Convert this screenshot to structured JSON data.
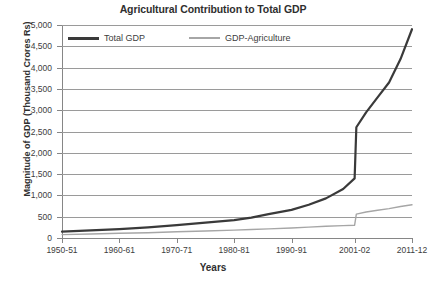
{
  "chart_data": {
    "type": "line",
    "title": "Agricultural Contribution to Total GDP",
    "xlabel": "Years",
    "ylabel": "Magnitude of GDP (Thousand Crores Rs)",
    "ylim": [
      0,
      5000
    ],
    "yticks": [
      0,
      500,
      1000,
      1500,
      2000,
      2500,
      3000,
      3500,
      4000,
      4500,
      5000
    ],
    "ytick_labels": [
      "0",
      "500",
      "1,000",
      "1,500",
      "2,000",
      "2,500",
      "3,000",
      "3,500",
      "4,000",
      "4,500",
      "5,000"
    ],
    "grid": true,
    "legend_position": "top-left-inside",
    "categories": [
      "1950-51",
      "1960-61",
      "1970-71",
      "1980-81",
      "1990-91",
      "2001-02",
      "2011-12"
    ],
    "xtick_labels": [
      "1950-51",
      "1960-61",
      "1970-71",
      "1980-81",
      "1990-91",
      "2001-02",
      "2011-12"
    ],
    "series": [
      {
        "name": "Total GDP",
        "color": "#3a3a3a",
        "width": 2.2,
        "x": [
          1950,
          1955,
          1960,
          1965,
          1970,
          1975,
          1980,
          1983,
          1986,
          1990,
          1993,
          1996,
          1999,
          2001,
          2001.3,
          2003,
          2005,
          2007,
          2009,
          2011
        ],
        "values": [
          150,
          180,
          210,
          250,
          300,
          360,
          420,
          480,
          560,
          660,
          780,
          930,
          1150,
          1400,
          2600,
          2950,
          3300,
          3650,
          4200,
          4900
        ]
      },
      {
        "name": "GDP-Agriculture",
        "color": "#a6a6a6",
        "width": 1.4,
        "x": [
          1950,
          1955,
          1960,
          1965,
          1970,
          1975,
          1980,
          1983,
          1986,
          1990,
          1993,
          1996,
          1999,
          2001,
          2001.3,
          2003,
          2005,
          2007,
          2009,
          2011
        ],
        "values": [
          80,
          95,
          110,
          125,
          145,
          165,
          185,
          200,
          215,
          235,
          255,
          275,
          290,
          300,
          560,
          610,
          650,
          690,
          740,
          780
        ]
      }
    ],
    "annotations": {
      "discontinuity_year": "2001-02",
      "note": "Sharp step increase in both series at 2001-02"
    }
  },
  "legend": {
    "entries": [
      {
        "label": "Total GDP"
      },
      {
        "label": "GDP-Agriculture"
      }
    ]
  }
}
